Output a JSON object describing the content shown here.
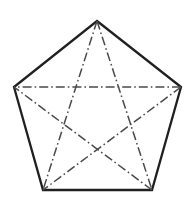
{
  "figure": {
    "name": "regular-pentagon-with-diagonals",
    "canvas": {
      "width": 194,
      "height": 207,
      "background_color": "#ffffff"
    },
    "outline": {
      "color": "#231f20",
      "width": 2.3,
      "style": "solid",
      "sides": 5,
      "closed": true
    },
    "diagonals": {
      "color": "#4a4a4a",
      "width": 1.5,
      "style": "dash-dot",
      "dash_pattern": "9 3 1.6 3",
      "count": 5
    },
    "vertices": [
      {
        "label": "A",
        "role": "apex",
        "x": 97,
        "y": 21
      },
      {
        "label": "B",
        "role": "right",
        "x": 181,
        "y": 87
      },
      {
        "label": "C",
        "role": "bottom-right",
        "x": 152,
        "y": 190
      },
      {
        "label": "D",
        "role": "bottom-left",
        "x": 43,
        "y": 190
      },
      {
        "label": "E",
        "role": "left",
        "x": 14,
        "y": 87
      }
    ],
    "polygon_points": "97,21 181,87 152,190 43,190 14,87",
    "diagonal_segments": [
      {
        "name": "A-C",
        "from": "A",
        "to": "C",
        "x1": 97,
        "y1": 21,
        "x2": 152,
        "y2": 190
      },
      {
        "name": "A-D",
        "from": "A",
        "to": "D",
        "x1": 97,
        "y1": 21,
        "x2": 43,
        "y2": 190
      },
      {
        "name": "B-D",
        "from": "B",
        "to": "D",
        "x1": 181,
        "y1": 87,
        "x2": 43,
        "y2": 190
      },
      {
        "name": "B-E",
        "from": "B",
        "to": "E",
        "x1": 181,
        "y1": 87,
        "x2": 14,
        "y2": 87
      },
      {
        "name": "C-E",
        "from": "C",
        "to": "E",
        "x1": 152,
        "y1": 190,
        "x2": 14,
        "y2": 87
      }
    ]
  }
}
